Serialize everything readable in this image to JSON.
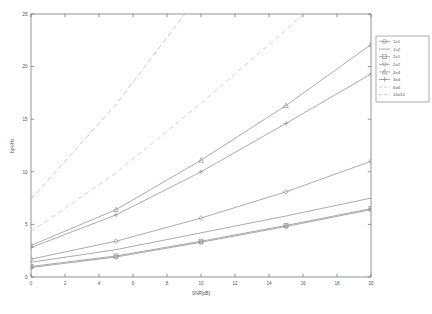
{
  "chart_data": {
    "type": "line",
    "title": "",
    "xlabel": "SNR[dB]",
    "ylabel": "bps/Hz",
    "xlim": [
      0,
      20
    ],
    "ylim": [
      0,
      25
    ],
    "xticks": [
      0,
      2,
      4,
      6,
      8,
      10,
      12,
      14,
      16,
      18,
      20
    ],
    "yticks": [
      0,
      5,
      10,
      15,
      20,
      25
    ],
    "grid": false,
    "legend_position": "outside-top-right",
    "x": [
      0,
      5,
      10,
      15,
      20
    ],
    "series": [
      {
        "name": "1x1",
        "marker": "circle",
        "linestyle": "solid",
        "color": "#8f8f8f",
        "values": [
          0.9,
          1.9,
          3.3,
          4.8,
          6.4
        ]
      },
      {
        "name": "1x2",
        "marker": "none",
        "linestyle": "solid",
        "color": "#8f8f8f",
        "values": [
          1.4,
          2.6,
          4.2,
          5.8,
          7.5
        ]
      },
      {
        "name": "2x1",
        "marker": "square",
        "linestyle": "solid",
        "color": "#8f8f8f",
        "values": [
          1.0,
          2.0,
          3.4,
          4.9,
          6.5
        ]
      },
      {
        "name": "2x2",
        "marker": "diamond",
        "linestyle": "solid",
        "color": "#8f8f8f",
        "values": [
          1.7,
          3.4,
          5.6,
          8.1,
          11.0
        ]
      },
      {
        "name": "4x4",
        "marker": "triangle",
        "linestyle": "solid",
        "color": "#8f8f8f",
        "values": [
          3.0,
          6.4,
          11.1,
          16.3,
          22.1
        ]
      },
      {
        "name": "3x4",
        "marker": "plus",
        "linestyle": "solid",
        "color": "#8f8f8f",
        "values": [
          2.8,
          5.9,
          10.0,
          14.6,
          19.3
        ]
      },
      {
        "name": "6x6",
        "marker": "none",
        "linestyle": "dashed",
        "color": "#c2c2c2",
        "values": [
          4.3,
          9.9,
          16.5,
          23.5,
          31.0
        ]
      },
      {
        "name": "10x10",
        "marker": "none",
        "linestyle": "dashed",
        "color": "#b4b4b4",
        "values": [
          7.4,
          16.4,
          27.0,
          38.0,
          49.0
        ]
      }
    ]
  },
  "figure": {
    "background": "#ffffff",
    "axis_color": "#7a7a7a",
    "text_color": "#555555"
  }
}
